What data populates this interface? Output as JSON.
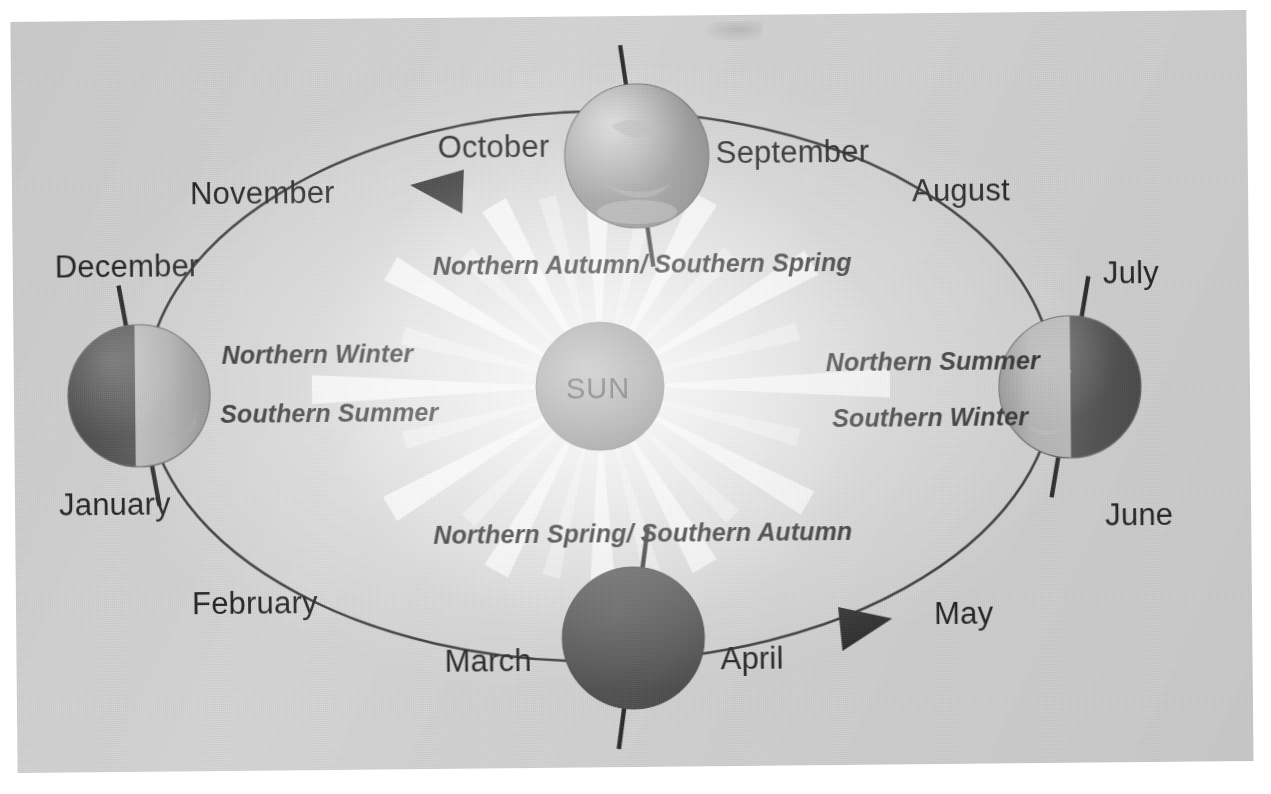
{
  "diagram": {
    "center_body": {
      "label": "SUN"
    },
    "orbit_direction": "counter-clockwise",
    "arrows": [
      {
        "name": "orbit-arrow-top",
        "points": "left"
      },
      {
        "name": "orbit-arrow-bottom",
        "points": "right"
      }
    ],
    "months": [
      {
        "name": "october",
        "label": "October"
      },
      {
        "name": "november",
        "label": "November"
      },
      {
        "name": "december",
        "label": "December"
      },
      {
        "name": "january",
        "label": "January"
      },
      {
        "name": "february",
        "label": "February"
      },
      {
        "name": "march",
        "label": "March"
      },
      {
        "name": "april",
        "label": "April"
      },
      {
        "name": "may",
        "label": "May"
      },
      {
        "name": "june",
        "label": "June"
      },
      {
        "name": "july",
        "label": "July"
      },
      {
        "name": "august",
        "label": "August"
      },
      {
        "name": "september",
        "label": "September"
      }
    ],
    "season_labels": [
      {
        "name": "top",
        "label": "Northern Autumn/ Southern Spring"
      },
      {
        "name": "bottom",
        "label": "Northern Spring/ Southern Autumn"
      },
      {
        "name": "left-1",
        "label": "Northern Winter"
      },
      {
        "name": "left-2",
        "label": "Southern Summer"
      },
      {
        "name": "right-1",
        "label": "Northern Summer"
      },
      {
        "name": "right-2",
        "label": "Southern Winter"
      }
    ],
    "earths": [
      {
        "name": "earth-september-october",
        "position": "top",
        "illumination": "fully lit",
        "axis_tilt_deg": -8
      },
      {
        "name": "earth-december-january",
        "position": "left",
        "illumination": "right half lit",
        "axis_tilt_deg": -10
      },
      {
        "name": "earth-march-april",
        "position": "bottom",
        "illumination": "in shadow",
        "axis_tilt_deg": 8
      },
      {
        "name": "earth-june-july",
        "position": "right",
        "illumination": "left half lit",
        "axis_tilt_deg": 10
      }
    ],
    "colors": {
      "paper": "#d7d7d7",
      "ink": "#242424",
      "sun_fill": "#8c8c8c",
      "earth_light": "#b9b9b9",
      "earth_dark": "#565656",
      "orbit_line": "#3a3a3a"
    }
  }
}
